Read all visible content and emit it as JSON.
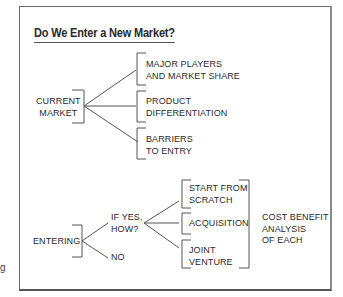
{
  "diagram": {
    "title": "Do We Enter a New Market?",
    "branch_current": {
      "root": [
        "CURRENT",
        "MARKET"
      ],
      "children": [
        [
          "MAJOR PLAYERS",
          "AND MARKET SHARE"
        ],
        [
          "PRODUCT",
          "DIFFERENTIATION"
        ],
        [
          "BARRIERS",
          "TO ENTRY"
        ]
      ]
    },
    "branch_entering": {
      "root": "ENTERING",
      "yes": [
        "IF YES,",
        "HOW?"
      ],
      "no": "NO",
      "options": [
        [
          "START FROM",
          "SCRATCH"
        ],
        [
          "ACQUISITION"
        ],
        [
          "JOINT",
          "VENTURE"
        ]
      ],
      "summary": [
        "COST BENEFIT",
        "ANALYSIS",
        "OF EACH"
      ]
    },
    "edge_fragment": "g"
  },
  "colors": {
    "line": "#555555",
    "text": "#2a2a2a",
    "frame": "#6a6a6a"
  }
}
